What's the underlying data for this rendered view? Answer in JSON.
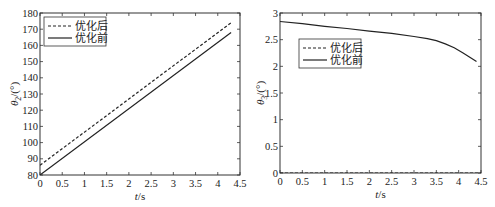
{
  "chart_data": [
    {
      "type": "line",
      "title": "",
      "xlabel": "t/s",
      "ylabel": "θ2/(°)",
      "xlim": [
        0,
        4.5
      ],
      "ylim": [
        80,
        180
      ],
      "xticks": [
        "0",
        "0.5",
        "1",
        "1.5",
        "2",
        "2.5",
        "3",
        "3.5",
        "4",
        "4.5"
      ],
      "yticks": [
        "80",
        "90",
        "100",
        "110",
        "120",
        "130",
        "140",
        "150",
        "160",
        "170",
        "180"
      ],
      "grid": false,
      "legend_position": "upper left",
      "series": [
        {
          "name": "优化后",
          "style": "dashed",
          "x": [
            0,
            4.3
          ],
          "y": [
            86,
            174
          ]
        },
        {
          "name": "优化前",
          "style": "solid",
          "x": [
            0,
            4.3
          ],
          "y": [
            80,
            168
          ]
        }
      ]
    },
    {
      "type": "line",
      "title": "",
      "xlabel": "t/s",
      "ylabel": "θ3/(°)",
      "xlim": [
        0,
        4.5
      ],
      "ylim": [
        0,
        3
      ],
      "xticks": [
        "0",
        "0.5",
        "1",
        "1.5",
        "2",
        "2.5",
        "3",
        "3.5",
        "4",
        "4.5"
      ],
      "yticks": [
        "0",
        "0.5",
        "1",
        "1.5",
        "2",
        "2.5",
        "3"
      ],
      "grid": false,
      "legend_position": "upper left (inset)",
      "series": [
        {
          "name": "优化后",
          "style": "dashed",
          "x": [
            0,
            4.5
          ],
          "y": [
            0,
            0
          ]
        },
        {
          "name": "优化前",
          "style": "solid",
          "x": [
            0,
            0.5,
            1.0,
            1.5,
            2.0,
            2.5,
            3.0,
            3.3,
            3.5,
            3.7,
            3.9,
            4.1,
            4.25,
            4.4
          ],
          "y": [
            2.84,
            2.8,
            2.75,
            2.71,
            2.66,
            2.62,
            2.56,
            2.52,
            2.48,
            2.42,
            2.35,
            2.25,
            2.17,
            2.09
          ]
        }
      ]
    }
  ]
}
